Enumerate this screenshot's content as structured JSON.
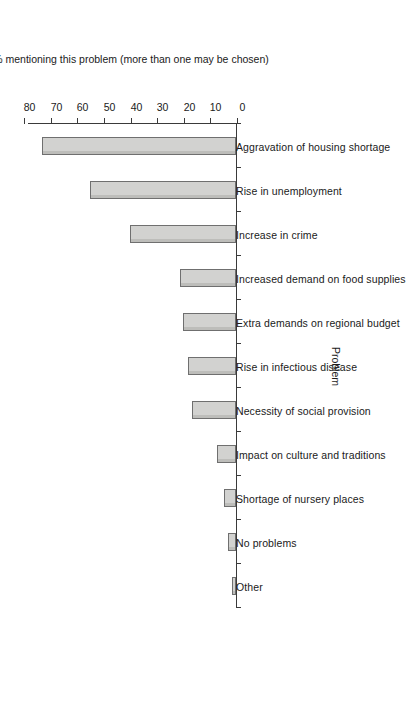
{
  "chart_data": {
    "type": "bar",
    "orientation": "vertical-rotated",
    "title": "",
    "xlabel": "Problem",
    "ylabel": "% mentioning this problem (more than one may be chosen)",
    "ylim": [
      0,
      80
    ],
    "yticks": [
      0,
      10,
      20,
      30,
      40,
      50,
      60,
      70,
      80
    ],
    "ytick_labels": [
      "0",
      "10",
      "20",
      "30",
      "40",
      "50",
      "60",
      "70",
      "80"
    ],
    "grid": false,
    "legend": null,
    "categories": [
      "Other",
      "No problems",
      "Shortage of nursery places",
      "Impact on culture and traditions",
      "Necessity of social provision",
      "Rise in infectious disease",
      "Extra demands on regional budget",
      "Increased demand on food supplies",
      "Increase in crime",
      "Rise in unemployment",
      "Aggravation of housing shortage"
    ],
    "values": [
      1.5,
      3,
      4.5,
      7,
      16.5,
      18,
      20,
      21,
      40,
      55,
      73
    ],
    "bar_fill_color": "#d2d2d0",
    "bar_edge_color": "#6f6f6f",
    "axis_color": "#3a3a3a",
    "background_color": "#ffffff"
  }
}
